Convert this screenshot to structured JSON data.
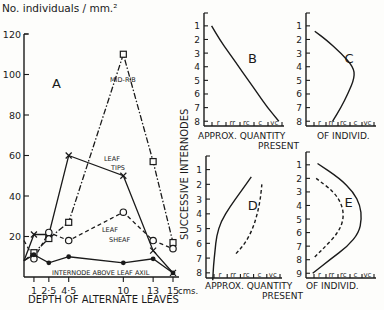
{
  "chart_data": [
    {
      "id": "A",
      "type": "line",
      "panel_label": "A",
      "title": "",
      "ylabel": "No. individuals / mm.²",
      "xlabel": "DEPTH OF ALTERNATE LEAVES",
      "x_unit_label": "cms.",
      "ylim": [
        0,
        120
      ],
      "xlim": [
        0,
        15
      ],
      "yticks": [
        20,
        40,
        60,
        80,
        100,
        120
      ],
      "xticks": [
        {
          "value": 1,
          "label": "1"
        },
        {
          "value": 2.5,
          "label": "2·5"
        },
        {
          "value": 4.5,
          "label": "4·5"
        },
        {
          "value": 10,
          "label": "10"
        },
        {
          "value": 13,
          "label": "13"
        },
        {
          "value": 15,
          "label": "15"
        }
      ],
      "series": [
        {
          "name": "MID-RIB",
          "style": "dash-dot",
          "marker": "square",
          "x": [
            0,
            1,
            2.5,
            4.5,
            10,
            13,
            15
          ],
          "values": [
            8,
            12,
            19,
            27,
            110,
            57,
            17
          ]
        },
        {
          "name": "LEAF TIPS",
          "style": "solid",
          "marker": "cross",
          "x": [
            0,
            1,
            2.5,
            4.5,
            10,
            13,
            15
          ],
          "values": [
            8,
            21,
            21,
            60,
            50,
            13,
            2
          ]
        },
        {
          "name": "LEAF SHEAF",
          "style": "dashed",
          "marker": "circle",
          "x": [
            0,
            1,
            2.5,
            4.5,
            10,
            13,
            15
          ],
          "values": [
            18,
            9,
            22,
            18,
            32,
            18,
            14
          ]
        },
        {
          "name": "INTERNODE ABOVE LEAF AXIL",
          "style": "solid",
          "marker": "dot",
          "x": [
            0,
            1,
            2.5,
            4.5,
            10,
            13,
            15
          ],
          "values": [
            8,
            11,
            7,
            10,
            7,
            9,
            2
          ]
        }
      ],
      "series_labels": [
        "MID-RIB",
        "LEAF TIPS",
        "LEAF",
        "SHEAF",
        "INTERNODE ABOVE LEAF AXIL"
      ]
    },
    {
      "id": "B",
      "type": "line",
      "panel_label": "B",
      "xlabel": "APPROX. QUANTITY PRESENT",
      "ylabel": "SUCCESSIVE INTERNODES",
      "yticks": [
        "1",
        "2",
        "3",
        "4",
        "5",
        "6",
        "7",
        "8"
      ],
      "xticks": [
        "r",
        "rr",
        "rc",
        "c",
        "vc"
      ],
      "series": [
        {
          "name": "B",
          "style": "solid",
          "internode": [
            1,
            2,
            3,
            4,
            5,
            6,
            7,
            8
          ],
          "quantity": [
            0.1,
            0.6,
            1.2,
            1.8,
            2.4,
            3.0,
            3.6,
            4.3
          ]
        }
      ]
    },
    {
      "id": "C",
      "type": "line",
      "panel_label": "C",
      "xlabel": "OF INDIVID.",
      "yticks": [
        "1",
        "2",
        "3",
        "4",
        "5",
        "6",
        "7",
        "8"
      ],
      "xticks": [
        "r",
        "rr",
        "rc",
        "c",
        "vc"
      ],
      "series": [
        {
          "name": "C",
          "style": "solid",
          "internode": [
            1.4,
            2,
            3,
            4,
            4.8,
            6,
            7,
            8
          ],
          "quantity": [
            0.2,
            1.0,
            2.1,
            3.0,
            3.1,
            2.6,
            2.1,
            1.5
          ]
        }
      ]
    },
    {
      "id": "D",
      "type": "line",
      "panel_label": "D",
      "xlabel": "APPROX. QUANTITY PRESENT",
      "yticks": [
        "1",
        "2",
        "3",
        "4",
        "5",
        "6",
        "7",
        "8"
      ],
      "xticks": [
        "r",
        "rr",
        "rc",
        "c",
        "vc"
      ],
      "series": [
        {
          "name": "solid",
          "style": "solid",
          "internode": [
            1.5,
            2.5,
            3.5,
            4.5,
            5.5,
            6.5,
            7.5,
            8.5
          ],
          "quantity": [
            2.6,
            1.9,
            1.2,
            0.6,
            0.3,
            0.2,
            0.1,
            0.05
          ]
        },
        {
          "name": "dashed",
          "style": "dashed",
          "internode": [
            2,
            3,
            4,
            5,
            6,
            6.8
          ],
          "quantity": [
            3.3,
            3.2,
            3.0,
            2.7,
            2.2,
            1.5
          ]
        }
      ]
    },
    {
      "id": "E",
      "type": "line",
      "panel_label": "E",
      "xlabel": "OF INDIVID.",
      "yticks": [
        "1",
        "2",
        "3",
        "4",
        "5",
        "6",
        "7",
        "8",
        "9"
      ],
      "xticks": [
        "r",
        "rr",
        "rc",
        "c",
        "vc"
      ],
      "series": [
        {
          "name": "solid",
          "style": "solid",
          "internode": [
            0.9,
            2,
            3,
            4,
            5,
            6,
            7,
            8,
            9
          ],
          "quantity": [
            0.4,
            2.0,
            3.0,
            3.5,
            3.6,
            3.4,
            2.6,
            1.3,
            0.05
          ]
        },
        {
          "name": "dashed",
          "style": "dashed",
          "internode": [
            2,
            3,
            4,
            5,
            6,
            7,
            7.8
          ],
          "quantity": [
            0.3,
            1.6,
            2.2,
            2.3,
            1.9,
            1.0,
            0.2
          ]
        }
      ]
    }
  ],
  "labels": {
    "y_axis_title": "No.  individuals / mm.²",
    "x_axis_title": "DEPTH OF ALTERNATE LEAVES",
    "x_unit": "cms.",
    "panel_A": "A",
    "mid_rib": "MID-RIB",
    "leaf_tips_1": "LEAF",
    "leaf_tips_2": "TIPS",
    "leaf_sheaf_1": "LEAF",
    "leaf_sheaf_2": "SHEAF",
    "internode": "INTERNODE  ABOVE  LEAF  AXIL",
    "vertical_title": "SUCCESSIVE  INTERNODES",
    "approx_qty": "APPROX.  QUANTITY",
    "present": "PRESENT",
    "of_individ": "OF  INDIVID."
  }
}
